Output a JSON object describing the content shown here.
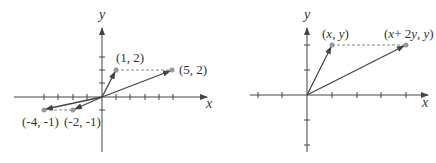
{
  "left_plot": {
    "x_axis_label": "x",
    "y_axis_label": "y",
    "points": [
      {
        "label": "(1, 2)",
        "x": 1,
        "y": 2
      },
      {
        "label": "(5, 2)",
        "x": 5,
        "y": 2
      },
      {
        "label": "(-4, -1)",
        "x": -4,
        "y": -1
      },
      {
        "label": "(-2, -1)",
        "x": -2,
        "y": -1
      }
    ]
  },
  "right_plot": {
    "x_axis_label": "x",
    "y_axis_label": "y",
    "points": [
      {
        "label_parts": [
          "(",
          "x",
          ", ",
          "y",
          ")"
        ],
        "label": "(x, y)"
      },
      {
        "label_parts": [
          "(",
          "x",
          "+ 2",
          "y",
          ", ",
          "y",
          ")"
        ],
        "label": "(x+ 2y, y)"
      }
    ]
  },
  "colors": {
    "axis": "#444444",
    "vector": "#444444",
    "point": "#999999",
    "dashed": "#888888"
  }
}
